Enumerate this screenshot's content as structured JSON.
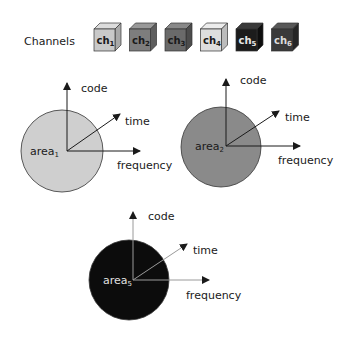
{
  "channels": {
    "label": "Channels",
    "items": [
      {
        "name": "ch",
        "sub": "1",
        "front": "#c9c9c9",
        "top": "#dcdcdc",
        "side": "#a9a9a9",
        "text": "#1a1a1a"
      },
      {
        "name": "ch",
        "sub": "2",
        "front": "#7d7d7d",
        "top": "#999999",
        "side": "#5e5e5e",
        "text": "#1a1a1a"
      },
      {
        "name": "ch",
        "sub": "3",
        "front": "#6a6a6a",
        "top": "#888888",
        "side": "#4c4c4c",
        "text": "#1a1a1a"
      },
      {
        "name": "ch",
        "sub": "4",
        "front": "#dedede",
        "top": "#ececec",
        "side": "#bcbcbc",
        "text": "#1a1a1a"
      },
      {
        "name": "ch",
        "sub": "5",
        "front": "#1c1c1c",
        "top": "#3a3a3a",
        "side": "#0e0e0e",
        "text": "#e8e8e8"
      },
      {
        "name": "ch",
        "sub": "6",
        "front": "#3a3a3a",
        "top": "#585858",
        "side": "#262626",
        "text": "#dddddd"
      }
    ]
  },
  "diagrams": [
    {
      "area": "area",
      "area_sub": "1",
      "fill": "#cfcfcf",
      "area_text": "#1a1a1a",
      "axes": {
        "code": "code",
        "time": "time",
        "frequency": "frequency"
      }
    },
    {
      "area": "area",
      "area_sub": "2",
      "fill": "#8a8a8a",
      "area_text": "#1a1a1a",
      "axes": {
        "code": "code",
        "time": "time",
        "frequency": "frequency"
      }
    },
    {
      "area": "area",
      "area_sub": "5",
      "fill": "#0c0c0c",
      "area_text": "#e0e0e0",
      "axes": {
        "code": "code",
        "time": "time",
        "frequency": "frequency"
      }
    }
  ]
}
